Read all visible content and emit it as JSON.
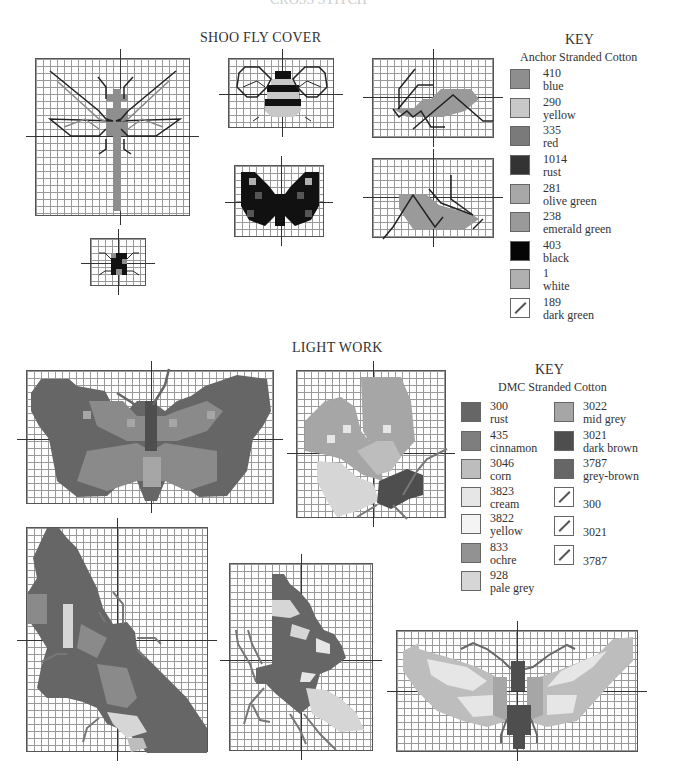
{
  "page": {
    "top_title": "CROSS STITCH"
  },
  "shoo_fly": {
    "heading": "SHOO FLY COVER",
    "charts": [
      {
        "name": "dragonfly"
      },
      {
        "name": "bee"
      },
      {
        "name": "grasshopper-top"
      },
      {
        "name": "butterfly-black"
      },
      {
        "name": "grasshopper-bottom"
      },
      {
        "name": "ladybird"
      }
    ],
    "key": {
      "title": "KEY",
      "subtitle": "Anchor Stranded Cotton",
      "items": [
        {
          "code": "410",
          "name": "blue",
          "color": "#8e8e8e",
          "type": "fill"
        },
        {
          "code": "290",
          "name": "yellow",
          "color": "#c8c8c8",
          "type": "fill"
        },
        {
          "code": "335",
          "name": "red",
          "color": "#7a7a7a",
          "type": "fill"
        },
        {
          "code": "1014",
          "name": "rust",
          "color": "#333333",
          "type": "fill"
        },
        {
          "code": "281",
          "name": "olive green",
          "color": "#a8a8a8",
          "type": "fill"
        },
        {
          "code": "238",
          "name": "emerald green",
          "color": "#9a9a9a",
          "type": "fill"
        },
        {
          "code": "403",
          "name": "black",
          "color": "#050505",
          "type": "fill"
        },
        {
          "code": "1",
          "name": "white",
          "color": "#b0b0b0",
          "type": "fill"
        },
        {
          "code": "189",
          "name": "dark green",
          "color": "#555555",
          "type": "line"
        }
      ]
    }
  },
  "light_work": {
    "heading": "LIGHT WORK",
    "charts": [
      {
        "name": "butterfly-wide"
      },
      {
        "name": "butterfly-side"
      },
      {
        "name": "butterfly-diagonal"
      },
      {
        "name": "butterfly-profile"
      },
      {
        "name": "moth"
      }
    ],
    "key": {
      "title": "KEY",
      "subtitle": "DMC Stranded Cotton",
      "col1": [
        {
          "code": "300",
          "name": "rust",
          "color": "#666666",
          "type": "fill"
        },
        {
          "code": "435",
          "name": "cinnamon",
          "color": "#7e7e7e",
          "type": "fill"
        },
        {
          "code": "3046",
          "name": "corn",
          "color": "#bdbdbd",
          "type": "fill"
        },
        {
          "code": "3823",
          "name": "cream",
          "color": "#e6e6e6",
          "type": "fill"
        },
        {
          "code": "3822",
          "name": "yellow",
          "color": "#f4f4f4",
          "type": "fill"
        },
        {
          "code": "833",
          "name": "ochre",
          "color": "#929292",
          "type": "fill"
        },
        {
          "code": "928",
          "name": "pale grey",
          "color": "#d6d6d6",
          "type": "fill"
        }
      ],
      "col2": [
        {
          "code": "3022",
          "name": "mid grey",
          "color": "#a6a6a6",
          "type": "fill"
        },
        {
          "code": "3021",
          "name": "dark brown",
          "color": "#4e4e4e",
          "type": "fill"
        },
        {
          "code": "3787",
          "name": "grey-brown",
          "color": "#666666",
          "type": "fill"
        },
        {
          "code": "300",
          "name": "",
          "color": "#555555",
          "type": "line"
        },
        {
          "code": "3021",
          "name": "",
          "color": "#555555",
          "type": "line"
        },
        {
          "code": "3787",
          "name": "",
          "color": "#555555",
          "type": "line"
        }
      ]
    }
  }
}
